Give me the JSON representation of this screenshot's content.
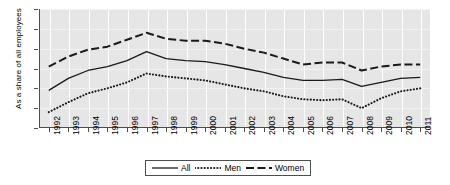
{
  "chart_data": {
    "type": "line",
    "title": "",
    "xlabel": "",
    "ylabel": "As a share of all employees",
    "ylim": [
      4,
      10
    ],
    "yticks": [
      4,
      5,
      6,
      7,
      8,
      9,
      10
    ],
    "grid": "vertical white gridlines on gray panel",
    "legend_position": "bottom-center",
    "categories": [
      "1992",
      "1993",
      "1994",
      "1995",
      "1996",
      "1997",
      "1998",
      "1999",
      "2000",
      "2001",
      "2002",
      "2003",
      "2004",
      "2005",
      "2006",
      "2007",
      "2008",
      "2009",
      "2010",
      "2011"
    ],
    "series": [
      {
        "name": "All",
        "style": "solid",
        "values": [
          5.9,
          6.5,
          6.9,
          7.1,
          7.4,
          7.85,
          7.5,
          7.4,
          7.35,
          7.2,
          7.0,
          6.8,
          6.55,
          6.4,
          6.4,
          6.45,
          6.1,
          6.3,
          6.5,
          6.55
        ]
      },
      {
        "name": "Men",
        "style": "dotted",
        "values": [
          4.8,
          5.3,
          5.75,
          6.0,
          6.3,
          6.75,
          6.6,
          6.5,
          6.4,
          6.2,
          6.0,
          5.85,
          5.6,
          5.45,
          5.4,
          5.45,
          5.0,
          5.5,
          5.85,
          6.0
        ]
      },
      {
        "name": "Women",
        "style": "dashed",
        "values": [
          7.1,
          7.6,
          7.95,
          8.1,
          8.45,
          8.8,
          8.5,
          8.4,
          8.4,
          8.25,
          8.0,
          7.8,
          7.5,
          7.2,
          7.3,
          7.3,
          6.9,
          7.1,
          7.2,
          7.2
        ]
      }
    ]
  },
  "legend": {
    "items": [
      {
        "label": "All",
        "style": "solid"
      },
      {
        "label": "Men",
        "style": "dotted"
      },
      {
        "label": "Women",
        "style": "dashed"
      }
    ]
  }
}
